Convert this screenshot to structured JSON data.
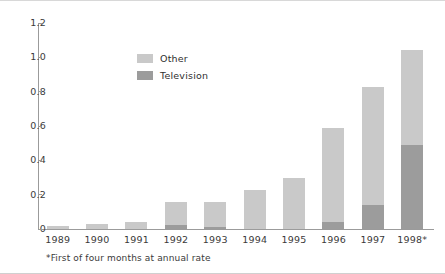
{
  "chart_data": {
    "type": "bar",
    "subtype": "stacked-vertical",
    "title": "",
    "subtitle": "",
    "xlabel": "",
    "ylabel": "",
    "categories": [
      "1989",
      "1990",
      "1991",
      "1992",
      "1993",
      "1994",
      "1995",
      "1996",
      "1997",
      "1998*"
    ],
    "series": [
      {
        "name": "Television",
        "color": "#9c9c9c",
        "values": [
          0.0,
          0.0,
          0.0,
          0.025,
          0.01,
          0.0,
          0.0,
          0.04,
          0.14,
          0.49
        ]
      },
      {
        "name": "Other",
        "color": "#c9c9c9",
        "values": [
          0.015,
          0.03,
          0.04,
          0.13,
          0.15,
          0.23,
          0.3,
          0.55,
          0.69,
          0.55
        ]
      }
    ],
    "totals": [
      0.015,
      0.03,
      0.04,
      0.155,
      0.16,
      0.23,
      0.3,
      0.59,
      0.83,
      1.04
    ],
    "ylim": [
      0,
      1.2
    ],
    "yticks": [
      "0",
      "0.2",
      "0.4",
      "0.6",
      "0.8",
      "1.0",
      "1.2"
    ],
    "ytick_values": [
      0,
      0.2,
      0.4,
      0.6,
      0.8,
      1.0,
      1.2
    ],
    "grid": false,
    "legend_position": "inside-upper-left",
    "annotations": [
      "*First of four months at annual rate"
    ]
  },
  "legend": {
    "items": [
      {
        "label": "Other",
        "color": "#c9c9c9"
      },
      {
        "label": "Television",
        "color": "#9c9c9c"
      }
    ]
  },
  "footnote": {
    "text": "*First of four months at annual rate"
  }
}
